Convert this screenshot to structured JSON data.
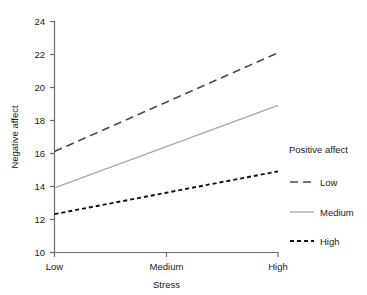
{
  "chart_data": {
    "type": "line",
    "title": "",
    "xlabel": "Stress",
    "ylabel": "Negative affect",
    "categories": [
      "Low",
      "Medium",
      "High"
    ],
    "x": [
      0,
      1,
      2
    ],
    "xlim": [
      0,
      2
    ],
    "ylim": [
      10,
      24
    ],
    "yticks": [
      10,
      12,
      14,
      16,
      18,
      20,
      22,
      24
    ],
    "ytick_labels": [
      "10",
      "12",
      "14",
      "16",
      "18",
      "20",
      "22",
      "24"
    ],
    "xtick_labels": [
      "Low",
      "Medium",
      "High"
    ],
    "grid": false,
    "legend_position": "right",
    "legend_title": "Positive affect",
    "series": [
      {
        "name": "Low",
        "values": [
          16.1,
          19.1,
          22.1
        ],
        "style": "dashed",
        "color": "#4a4a4a"
      },
      {
        "name": "Medium",
        "values": [
          13.9,
          16.4,
          18.9
        ],
        "style": "solid",
        "color": "#a8a8a8"
      },
      {
        "name": "High",
        "values": [
          12.3,
          13.6,
          14.9
        ],
        "style": "dotted",
        "color": "#111111"
      }
    ]
  },
  "axes": {
    "y_title": "Negative affect",
    "x_title": "Stress",
    "y_tick_10": "10",
    "y_tick_12": "12",
    "y_tick_14": "14",
    "y_tick_16": "16",
    "y_tick_18": "18",
    "y_tick_20": "20",
    "y_tick_22": "22",
    "y_tick_24": "24",
    "x_tick_low": "Low",
    "x_tick_medium": "Medium",
    "x_tick_high": "High"
  },
  "legend": {
    "title": "Positive affect",
    "items": [
      {
        "label": "Low"
      },
      {
        "label": "Medium"
      },
      {
        "label": "High"
      }
    ]
  },
  "colors": {
    "axis": "#6b6b6b",
    "series_low": "#4a4a4a",
    "series_medium": "#a8a8a8",
    "series_high": "#111111",
    "background": "#ffffff",
    "text": "#1a1a1a"
  }
}
